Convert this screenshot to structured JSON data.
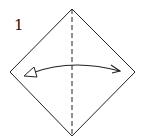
{
  "diagram": {
    "type": "origami-step",
    "step_number": "1",
    "colors": {
      "background": "#ffffff",
      "stroke": "#222222"
    },
    "square": {
      "orientation": "diamond",
      "vertices": {
        "top": [
          72,
          9
        ],
        "right": [
          135,
          72
        ],
        "bottom": [
          72,
          136
        ],
        "left": [
          10,
          72
        ]
      }
    },
    "fold_line": {
      "style": "valley-fold-dashed",
      "from": [
        72,
        9
      ],
      "to": [
        72,
        136
      ]
    },
    "arrow": {
      "type": "fold-and-unfold",
      "from": [
        24,
        76
      ],
      "control": [
        72,
        58
      ],
      "to": [
        120,
        71
      ],
      "start_head": "hollow-triangle",
      "end_head": "open-barb"
    }
  }
}
